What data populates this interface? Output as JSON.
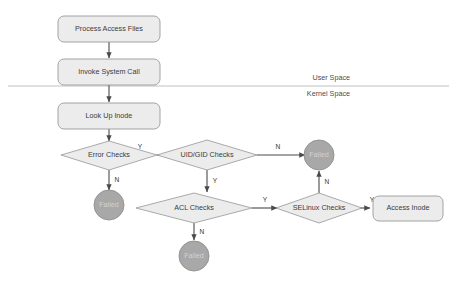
{
  "diagram": {
    "type": "flowchart",
    "background_color": "#ffffff",
    "node_fill_color": "#ececed",
    "node_stroke_color": "#9a9a9b",
    "terminal_fill_color": "#a8a8a9",
    "edge_color": "#4a4a4a",
    "divider_color": "#b9b9ba"
  },
  "nodes": {
    "process_access_files": {
      "label": "Process Access Files",
      "shape": "rounded-rect"
    },
    "invoke_system_call": {
      "label": "Invoke System Call",
      "shape": "rounded-rect"
    },
    "look_up_inode": {
      "label": "Look Up Inode",
      "shape": "rounded-rect"
    },
    "error_checks": {
      "label": "Error Checks",
      "shape": "diamond"
    },
    "uid_gid_checks": {
      "label": "UID/GID Checks",
      "shape": "diamond"
    },
    "acl_checks": {
      "label": "ACL Checks",
      "shape": "diamond"
    },
    "selinux_checks": {
      "label": "SELinux Checks",
      "shape": "diamond"
    },
    "access_inode": {
      "label": "Access Inode",
      "shape": "rounded-rect"
    },
    "failed_error": {
      "label": "Failed",
      "shape": "circle"
    },
    "failed_uid": {
      "label": "Failed",
      "shape": "circle"
    },
    "failed_acl": {
      "label": "Failed",
      "shape": "circle"
    }
  },
  "edge_labels": {
    "error_checks_yes": "Y",
    "error_checks_no": "N",
    "uid_gid_no": "N",
    "uid_gid_yes": "Y",
    "acl_yes": "Y",
    "acl_no": "N",
    "selinux_yes": "Y",
    "selinux_no": "N"
  },
  "regions": {
    "user_space": "User Space",
    "kernel_space": "Kernel Space"
  }
}
